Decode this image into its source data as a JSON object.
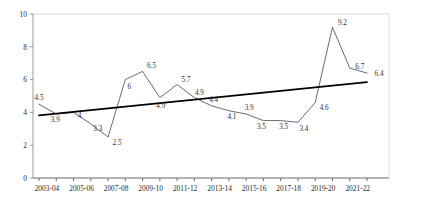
{
  "chart_data": {
    "type": "line",
    "title": "",
    "subtitle": "",
    "xlabel": "",
    "ylabel": "",
    "ylim": [
      0,
      10
    ],
    "yticks": [
      0,
      2,
      4,
      6,
      8,
      10
    ],
    "grid": false,
    "legend": "none",
    "categories": [
      "2003-04",
      "2004-05",
      "2005-06",
      "2006-07",
      "2007-08",
      "2008-09",
      "2009-10",
      "2010-11",
      "2011-12",
      "2012-13",
      "2013-14",
      "2014-15",
      "2015-16",
      "2016-17",
      "2017-18",
      "2018-19",
      "2019-20",
      "2020-21",
      "2021-22",
      "2022-23"
    ],
    "xtick_labels": [
      "2003-04",
      "2005-06",
      "2007-08",
      "2009-10",
      "2011-12",
      "2013-14",
      "2015-16",
      "2017-18",
      "2019-20",
      "2021-22"
    ],
    "series": [
      {
        "name": "value",
        "color": "#5a5a5a",
        "values": [
          4.5,
          3.9,
          4,
          3.3,
          2.5,
          6,
          6.5,
          4.9,
          5.7,
          4.9,
          4.4,
          4.1,
          3.9,
          3.5,
          3.5,
          3.4,
          4.6,
          9.2,
          6.7,
          6.4
        ],
        "point_labels": [
          "4.5",
          "3.9",
          "4",
          "3.3",
          "2.5",
          "6",
          "6.5",
          "4.9",
          "5.7",
          "4.9",
          "4.4",
          "4.1",
          "3.9",
          "3.5",
          "3.5",
          "3.4",
          "4.6",
          "9.2",
          "6.7",
          "6.4"
        ]
      },
      {
        "name": "trendline",
        "color": "#000000",
        "type": "linear-trend",
        "y_start": 3.82,
        "y_end": 5.85
      }
    ],
    "label_offsets": [
      {
        "dx": 0,
        "dy": -4
      },
      {
        "dx": -1,
        "dy": 8
      },
      {
        "dx": 6,
        "dy": 6
      },
      {
        "dx": 7,
        "dy": 7
      },
      {
        "dx": 9,
        "dy": 8
      },
      {
        "dx": 4,
        "dy": 9
      },
      {
        "dx": 9,
        "dy": -3
      },
      {
        "dx": 1,
        "dy": 10
      },
      {
        "dx": 9,
        "dy": -3
      },
      {
        "dx": 5,
        "dy": -3
      },
      {
        "dx": 2,
        "dy": -4
      },
      {
        "dx": 3,
        "dy": 8
      },
      {
        "dx": 3,
        "dy": -4
      },
      {
        "dx": -2,
        "dy": 8
      },
      {
        "dx": 3,
        "dy": 8
      },
      {
        "dx": 6,
        "dy": 9
      },
      {
        "dx": 9,
        "dy": 7
      },
      {
        "dx": 10,
        "dy": -2
      },
      {
        "dx": 10,
        "dy": 1
      },
      {
        "dx": 12,
        "dy": 3
      }
    ]
  },
  "axes": {
    "y_axis_color": "#9a9a9a",
    "x_axis_color": "#6a6a6a",
    "frame_color": "#d8d8d8"
  }
}
